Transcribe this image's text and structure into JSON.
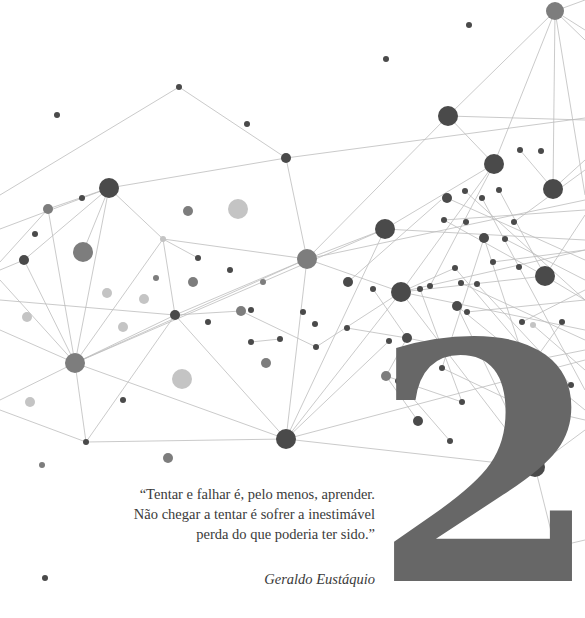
{
  "chapter": {
    "number": "2"
  },
  "epigraph": {
    "lines": [
      "“Tentar e falhar é, pelo menos, aprender.",
      "Não chegar a tentar é sofrer a inestimável",
      "perda do que poderia ter sido.”"
    ],
    "author": "Geraldo Eustáquio"
  },
  "colors": {
    "background": "#ffffff",
    "numeral": "#676767",
    "text": "#3a3a3a",
    "edge": "#bdbdbd",
    "node_dark": "#4a4a4a",
    "node_mid": "#7d7d7d",
    "node_light": "#c4c4c4"
  },
  "network": {
    "nodes": [
      {
        "x": 555,
        "y": 11,
        "r": 9,
        "c": "mid"
      },
      {
        "x": 469,
        "y": 25,
        "r": 3,
        "c": "dark"
      },
      {
        "x": 386,
        "y": 59,
        "r": 3,
        "c": "dark"
      },
      {
        "x": 179,
        "y": 87,
        "r": 3,
        "c": "dark"
      },
      {
        "x": 57,
        "y": 115,
        "r": 3,
        "c": "dark"
      },
      {
        "x": 448,
        "y": 116,
        "r": 10,
        "c": "dark"
      },
      {
        "x": 247,
        "y": 124,
        "r": 3,
        "c": "dark"
      },
      {
        "x": 286,
        "y": 158,
        "r": 5,
        "c": "dark"
      },
      {
        "x": 494,
        "y": 164,
        "r": 10,
        "c": "dark"
      },
      {
        "x": 520,
        "y": 150,
        "r": 3,
        "c": "dark"
      },
      {
        "x": 541,
        "y": 151,
        "r": 3,
        "c": "dark"
      },
      {
        "x": 553,
        "y": 189,
        "r": 10,
        "c": "dark"
      },
      {
        "x": 109,
        "y": 188,
        "r": 10,
        "c": "dark"
      },
      {
        "x": 48,
        "y": 209,
        "r": 5,
        "c": "mid"
      },
      {
        "x": 82,
        "y": 198,
        "r": 3,
        "c": "dark"
      },
      {
        "x": 188,
        "y": 211,
        "r": 5,
        "c": "mid"
      },
      {
        "x": 238,
        "y": 209,
        "r": 10,
        "c": "light"
      },
      {
        "x": 447,
        "y": 198,
        "r": 5,
        "c": "dark"
      },
      {
        "x": 465,
        "y": 191,
        "r": 3,
        "c": "dark"
      },
      {
        "x": 482,
        "y": 198,
        "r": 3,
        "c": "dark"
      },
      {
        "x": 499,
        "y": 190,
        "r": 3,
        "c": "dark"
      },
      {
        "x": 385,
        "y": 229,
        "r": 10,
        "c": "dark"
      },
      {
        "x": 466,
        "y": 222,
        "r": 3,
        "c": "dark"
      },
      {
        "x": 444,
        "y": 220,
        "r": 3,
        "c": "dark"
      },
      {
        "x": 514,
        "y": 222,
        "r": 3,
        "c": "dark"
      },
      {
        "x": 35,
        "y": 234,
        "r": 3,
        "c": "dark"
      },
      {
        "x": 163,
        "y": 239,
        "r": 3,
        "c": "light"
      },
      {
        "x": 24,
        "y": 260,
        "r": 5,
        "c": "dark"
      },
      {
        "x": 83,
        "y": 252,
        "r": 10,
        "c": "mid"
      },
      {
        "x": 484,
        "y": 238,
        "r": 5,
        "c": "dark"
      },
      {
        "x": 505,
        "y": 239,
        "r": 3,
        "c": "dark"
      },
      {
        "x": 307,
        "y": 259,
        "r": 10,
        "c": "mid"
      },
      {
        "x": 198,
        "y": 258,
        "r": 3,
        "c": "dark"
      },
      {
        "x": 230,
        "y": 270,
        "r": 3,
        "c": "dark"
      },
      {
        "x": 156,
        "y": 278,
        "r": 3,
        "c": "mid"
      },
      {
        "x": 107,
        "y": 293,
        "r": 5,
        "c": "light"
      },
      {
        "x": 144,
        "y": 299,
        "r": 5,
        "c": "light"
      },
      {
        "x": 193,
        "y": 282,
        "r": 5,
        "c": "mid"
      },
      {
        "x": 263,
        "y": 282,
        "r": 3,
        "c": "mid"
      },
      {
        "x": 545,
        "y": 276,
        "r": 10,
        "c": "dark"
      },
      {
        "x": 519,
        "y": 267,
        "r": 3,
        "c": "dark"
      },
      {
        "x": 455,
        "y": 268,
        "r": 3,
        "c": "dark"
      },
      {
        "x": 493,
        "y": 262,
        "r": 3,
        "c": "dark"
      },
      {
        "x": 348,
        "y": 282,
        "r": 5,
        "c": "dark"
      },
      {
        "x": 373,
        "y": 289,
        "r": 3,
        "c": "dark"
      },
      {
        "x": 401,
        "y": 292,
        "r": 10,
        "c": "dark"
      },
      {
        "x": 420,
        "y": 289,
        "r": 3,
        "c": "dark"
      },
      {
        "x": 430,
        "y": 286,
        "r": 3,
        "c": "dark"
      },
      {
        "x": 461,
        "y": 283,
        "r": 3,
        "c": "dark"
      },
      {
        "x": 477,
        "y": 284,
        "r": 3,
        "c": "dark"
      },
      {
        "x": 27,
        "y": 317,
        "r": 5,
        "c": "light"
      },
      {
        "x": 123,
        "y": 327,
        "r": 5,
        "c": "light"
      },
      {
        "x": 175,
        "y": 315,
        "r": 5,
        "c": "dark"
      },
      {
        "x": 208,
        "y": 322,
        "r": 3,
        "c": "dark"
      },
      {
        "x": 241,
        "y": 311,
        "r": 5,
        "c": "mid"
      },
      {
        "x": 251,
        "y": 310,
        "r": 3,
        "c": "dark"
      },
      {
        "x": 251,
        "y": 342,
        "r": 3,
        "c": "dark"
      },
      {
        "x": 280,
        "y": 339,
        "r": 3,
        "c": "dark"
      },
      {
        "x": 303,
        "y": 312,
        "r": 3,
        "c": "dark"
      },
      {
        "x": 315,
        "y": 324,
        "r": 3,
        "c": "dark"
      },
      {
        "x": 316,
        "y": 347,
        "r": 3,
        "c": "dark"
      },
      {
        "x": 347,
        "y": 328,
        "r": 3,
        "c": "dark"
      },
      {
        "x": 389,
        "y": 341,
        "r": 3,
        "c": "dark"
      },
      {
        "x": 407,
        "y": 338,
        "r": 5,
        "c": "dark"
      },
      {
        "x": 457,
        "y": 306,
        "r": 5,
        "c": "dark"
      },
      {
        "x": 467,
        "y": 312,
        "r": 3,
        "c": "dark"
      },
      {
        "x": 522,
        "y": 322,
        "r": 3,
        "c": "dark"
      },
      {
        "x": 533,
        "y": 325,
        "r": 3,
        "c": "light"
      },
      {
        "x": 562,
        "y": 322,
        "r": 3,
        "c": "dark"
      },
      {
        "x": 75,
        "y": 363,
        "r": 10,
        "c": "mid"
      },
      {
        "x": 266,
        "y": 363,
        "r": 5,
        "c": "mid"
      },
      {
        "x": 182,
        "y": 379,
        "r": 10,
        "c": "light"
      },
      {
        "x": 386,
        "y": 376,
        "r": 5,
        "c": "mid"
      },
      {
        "x": 398,
        "y": 381,
        "r": 3,
        "c": "dark"
      },
      {
        "x": 442,
        "y": 368,
        "r": 3,
        "c": "dark"
      },
      {
        "x": 525,
        "y": 362,
        "r": 5,
        "c": "dark"
      },
      {
        "x": 534,
        "y": 361,
        "r": 3,
        "c": "dark"
      },
      {
        "x": 571,
        "y": 385,
        "r": 3,
        "c": "dark"
      },
      {
        "x": 30,
        "y": 402,
        "r": 5,
        "c": "light"
      },
      {
        "x": 123,
        "y": 400,
        "r": 3,
        "c": "dark"
      },
      {
        "x": 462,
        "y": 402,
        "r": 3,
        "c": "dark"
      },
      {
        "x": 520,
        "y": 405,
        "r": 3,
        "c": "dark"
      },
      {
        "x": 418,
        "y": 421,
        "r": 5,
        "c": "dark"
      },
      {
        "x": 86,
        "y": 442,
        "r": 3,
        "c": "dark"
      },
      {
        "x": 286,
        "y": 439,
        "r": 10,
        "c": "dark"
      },
      {
        "x": 450,
        "y": 441,
        "r": 3,
        "c": "dark"
      },
      {
        "x": 168,
        "y": 458,
        "r": 5,
        "c": "mid"
      },
      {
        "x": 42,
        "y": 465,
        "r": 3,
        "c": "mid"
      },
      {
        "x": 535,
        "y": 467,
        "r": 10,
        "c": "dark"
      },
      {
        "x": 555,
        "y": 547,
        "r": 5,
        "c": "dark"
      },
      {
        "x": 45,
        "y": 578,
        "r": 3,
        "c": "dark"
      }
    ],
    "edges": [
      [
        0,
        448,
        116,
        555,
        11
      ],
      [
        0,
        555,
        11,
        585,
        0
      ],
      [
        0,
        555,
        11,
        585,
        30
      ],
      [
        0,
        555,
        11,
        585,
        40
      ],
      [
        0,
        555,
        11,
        494,
        164
      ],
      [
        0,
        555,
        11,
        553,
        189
      ],
      [
        0,
        555,
        11,
        585,
        195
      ],
      [
        0,
        448,
        116,
        585,
        120
      ],
      [
        0,
        448,
        116,
        494,
        164
      ],
      [
        0,
        0,
        195,
        179,
        87
      ],
      [
        0,
        179,
        87,
        286,
        158
      ],
      [
        0,
        109,
        188,
        286,
        158
      ],
      [
        0,
        286,
        158,
        307,
        259
      ],
      [
        0,
        286,
        158,
        585,
        118
      ],
      [
        0,
        0,
        229,
        109,
        188
      ],
      [
        0,
        109,
        188,
        83,
        252
      ],
      [
        0,
        109,
        188,
        75,
        363
      ],
      [
        0,
        109,
        188,
        163,
        239
      ],
      [
        0,
        0,
        262,
        48,
        209
      ],
      [
        0,
        48,
        209,
        109,
        188
      ],
      [
        0,
        48,
        209,
        75,
        363
      ],
      [
        0,
        24,
        260,
        0,
        270
      ],
      [
        0,
        24,
        260,
        75,
        363
      ],
      [
        0,
        24,
        260,
        109,
        188
      ],
      [
        0,
        163,
        239,
        307,
        259
      ],
      [
        0,
        163,
        239,
        175,
        315
      ],
      [
        0,
        163,
        239,
        198,
        258
      ],
      [
        0,
        163,
        239,
        75,
        363
      ],
      [
        0,
        0,
        300,
        175,
        315
      ],
      [
        0,
        0,
        280,
        75,
        363
      ],
      [
        0,
        0,
        330,
        75,
        363
      ],
      [
        0,
        75,
        363,
        175,
        315
      ],
      [
        0,
        75,
        363,
        86,
        442
      ],
      [
        0,
        75,
        363,
        307,
        259
      ],
      [
        0,
        75,
        363,
        385,
        229
      ],
      [
        0,
        0,
        400,
        75,
        363
      ],
      [
        0,
        75,
        363,
        286,
        439
      ],
      [
        0,
        175,
        315,
        286,
        439
      ],
      [
        0,
        175,
        315,
        86,
        442
      ],
      [
        0,
        175,
        315,
        307,
        259
      ],
      [
        0,
        175,
        315,
        241,
        311
      ],
      [
        0,
        86,
        442,
        286,
        439
      ],
      [
        0,
        0,
        410,
        86,
        442
      ],
      [
        0,
        307,
        259,
        385,
        229
      ],
      [
        0,
        307,
        259,
        286,
        439
      ],
      [
        0,
        307,
        259,
        401,
        292
      ],
      [
        0,
        307,
        259,
        448,
        116
      ],
      [
        0,
        307,
        259,
        585,
        200
      ],
      [
        0,
        385,
        229,
        494,
        164
      ],
      [
        0,
        385,
        229,
        585,
        240
      ],
      [
        0,
        385,
        229,
        286,
        439
      ],
      [
        0,
        401,
        292,
        585,
        250
      ],
      [
        0,
        401,
        292,
        494,
        164
      ],
      [
        0,
        401,
        292,
        545,
        276
      ],
      [
        0,
        401,
        292,
        585,
        330
      ],
      [
        0,
        401,
        292,
        286,
        439
      ],
      [
        0,
        401,
        292,
        535,
        467
      ],
      [
        0,
        286,
        439,
        585,
        360
      ],
      [
        0,
        286,
        439,
        535,
        467
      ],
      [
        0,
        286,
        439,
        389,
        341
      ],
      [
        0,
        535,
        467,
        585,
        430
      ],
      [
        0,
        535,
        467,
        555,
        547
      ],
      [
        0,
        555,
        547,
        585,
        540
      ],
      [
        0,
        535,
        467,
        457,
        306
      ],
      [
        0,
        241,
        311,
        316,
        347
      ],
      [
        0,
        251,
        342,
        280,
        339
      ],
      [
        0,
        316,
        347,
        401,
        292
      ],
      [
        0,
        347,
        328,
        407,
        338
      ],
      [
        0,
        386,
        376,
        462,
        402
      ],
      [
        0,
        386,
        376,
        407,
        338
      ],
      [
        0,
        386,
        376,
        418,
        421
      ],
      [
        0,
        398,
        381,
        450,
        441
      ],
      [
        0,
        444,
        220,
        585,
        210
      ],
      [
        0,
        444,
        220,
        545,
        276
      ],
      [
        0,
        447,
        198,
        585,
        260
      ],
      [
        0,
        465,
        191,
        585,
        300
      ],
      [
        0,
        482,
        198,
        585,
        390
      ],
      [
        0,
        499,
        190,
        545,
        276
      ],
      [
        0,
        514,
        222,
        585,
        170
      ],
      [
        0,
        505,
        239,
        585,
        280
      ],
      [
        0,
        484,
        238,
        525,
        362
      ],
      [
        0,
        484,
        238,
        442,
        368
      ],
      [
        0,
        493,
        262,
        585,
        250
      ],
      [
        0,
        455,
        268,
        534,
        361
      ],
      [
        0,
        461,
        283,
        585,
        340
      ],
      [
        0,
        477,
        284,
        571,
        385
      ],
      [
        0,
        467,
        312,
        585,
        300
      ],
      [
        0,
        457,
        306,
        585,
        410
      ],
      [
        0,
        522,
        322,
        585,
        290
      ],
      [
        0,
        525,
        362,
        585,
        350
      ],
      [
        0,
        520,
        405,
        585,
        420
      ],
      [
        0,
        442,
        368,
        520,
        405
      ],
      [
        0,
        430,
        286,
        494,
        164
      ],
      [
        0,
        420,
        289,
        462,
        402
      ],
      [
        0,
        373,
        289,
        407,
        338
      ],
      [
        0,
        348,
        282,
        441,
        200
      ],
      [
        0,
        545,
        276,
        585,
        215
      ],
      [
        0,
        545,
        276,
        585,
        300
      ],
      [
        0,
        553,
        189,
        585,
        160
      ],
      [
        0,
        553,
        189,
        520,
        150
      ],
      [
        0,
        562,
        322,
        534,
        361
      ],
      [
        0,
        533,
        325,
        585,
        370
      ],
      [
        0,
        407,
        338,
        525,
        362
      ],
      [
        0,
        401,
        292,
        455,
        268
      ]
    ]
  }
}
